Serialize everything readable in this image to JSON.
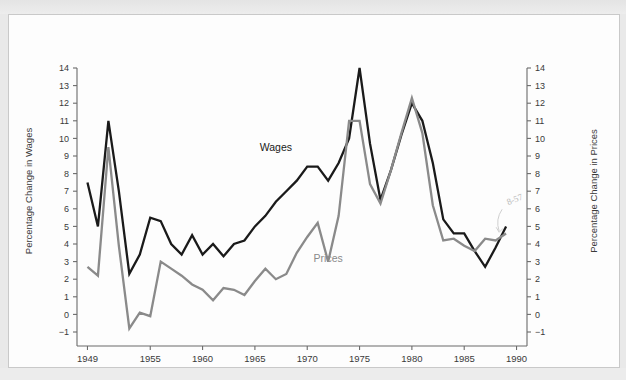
{
  "chart_data": {
    "type": "line",
    "title": "",
    "xlabel": "",
    "ylabel": "Percentage Change in Wages",
    "y2label": "Percentage Change in Prices",
    "xlim": [
      1948,
      1991
    ],
    "ylim": [
      -1,
      14
    ],
    "y2lim": [
      -1,
      14
    ],
    "grid": false,
    "legend_position": "inline-annotation",
    "xticks": [
      1949,
      1955,
      1960,
      1965,
      1970,
      1975,
      1980,
      1985,
      1990
    ],
    "xtick_labels": [
      "1949",
      "1955",
      "1960",
      "1965",
      "1970",
      "1975",
      "1980",
      "1985",
      "1990"
    ],
    "yticks": [
      -1,
      0,
      1,
      2,
      3,
      4,
      5,
      6,
      7,
      8,
      9,
      10,
      11,
      12,
      13,
      14
    ],
    "ytick_labels": [
      "−1",
      "0",
      "1",
      "2",
      "3",
      "4",
      "5",
      "6",
      "7",
      "8",
      "9",
      "10",
      "11",
      "12",
      "13",
      "14"
    ],
    "y2ticks": [
      -1,
      0,
      1,
      2,
      3,
      4,
      5,
      6,
      7,
      8,
      9,
      10,
      11,
      12,
      13,
      14
    ],
    "y2tick_labels": [
      "−1",
      "0",
      "1",
      "2",
      "3",
      "4",
      "5",
      "6",
      "7",
      "8",
      "9",
      "10",
      "11",
      "12",
      "13",
      "14"
    ],
    "x": [
      1949,
      1950,
      1951,
      1952,
      1953,
      1954,
      1955,
      1956,
      1957,
      1958,
      1959,
      1960,
      1961,
      1962,
      1963,
      1964,
      1965,
      1966,
      1967,
      1968,
      1969,
      1970,
      1971,
      1972,
      1973,
      1974,
      1975,
      1976,
      1977,
      1978,
      1979,
      1980,
      1981,
      1982,
      1983,
      1984,
      1985,
      1986,
      1987,
      1988,
      1989
    ],
    "series": [
      {
        "name": "Wages",
        "color": "#1a1a1a",
        "axis": "left",
        "label_x": 1967,
        "label_y": 9.3,
        "values": [
          7.5,
          5.0,
          11.0,
          7.0,
          2.3,
          3.4,
          5.5,
          5.3,
          4.0,
          3.4,
          4.5,
          3.4,
          4.0,
          3.3,
          4.0,
          4.2,
          5.0,
          5.6,
          6.4,
          7.0,
          7.6,
          8.4,
          8.4,
          7.6,
          8.6,
          10.0,
          14.0,
          9.7,
          6.5,
          8.2,
          10.2,
          12.0,
          11.0,
          8.6,
          5.4,
          4.6,
          4.6,
          3.6,
          2.7,
          3.8,
          5.0
        ]
      },
      {
        "name": "Prices",
        "color": "#8a8a8a",
        "axis": "right",
        "label_x": 1972,
        "label_y": 3.0,
        "values": [
          2.7,
          2.2,
          9.5,
          3.9,
          -0.8,
          0.1,
          -0.1,
          3.0,
          2.6,
          2.2,
          1.7,
          1.4,
          0.8,
          1.5,
          1.4,
          1.1,
          1.9,
          2.6,
          2.0,
          2.3,
          3.5,
          4.4,
          5.2,
          3.0,
          5.6,
          11.0,
          11.0,
          7.4,
          6.3,
          8.2,
          10.3,
          12.3,
          10.3,
          6.2,
          4.2,
          4.3,
          3.9,
          3.6,
          4.3,
          4.2,
          4.6
        ]
      }
    ],
    "annotations": [
      {
        "text": "8-57",
        "x": 1989.2,
        "y": 6.2,
        "style": "handwritten-pencil"
      }
    ]
  },
  "axes": {
    "left_title": "Percentage Change in Wages",
    "right_title": "Percentage Change in Prices"
  },
  "colors": {
    "wages": "#1a1a1a",
    "prices": "#8a8a8a",
    "axis": "#6b6b6b",
    "page": "#fdfdfd",
    "surround": "#e9e9e9"
  }
}
